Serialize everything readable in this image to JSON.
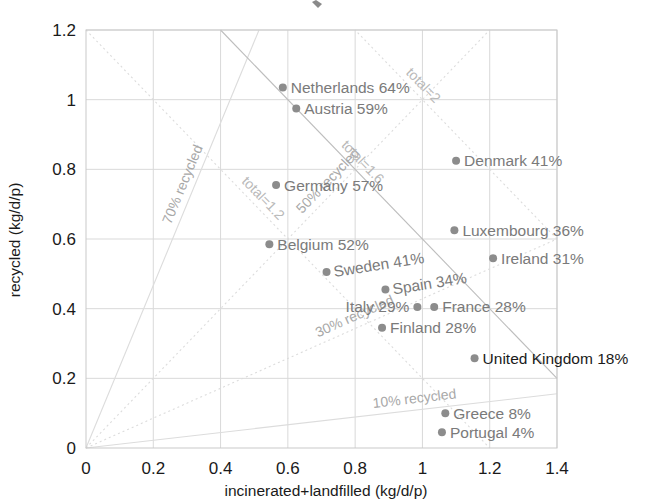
{
  "chart_data": {
    "type": "scatter",
    "title": "",
    "xlabel": "incinerated+landfilled (kg/d/p)",
    "ylabel": "recycled (kg/d/p)",
    "xlim": [
      0,
      1.4
    ],
    "ylim": [
      0,
      1.2
    ],
    "xticks": [
      "0",
      "0.2",
      "0.4",
      "0.6",
      "0.8",
      "1",
      "1.2",
      "1.4"
    ],
    "xtick_values": [
      0,
      0.2,
      0.4,
      0.6,
      0.8,
      1.0,
      1.2,
      1.4
    ],
    "yticks": [
      "0",
      "0.2",
      "0.4",
      "0.6",
      "0.8",
      "1",
      "1.2"
    ],
    "ytick_values": [
      0,
      0.2,
      0.4,
      0.6,
      0.8,
      1.0,
      1.2
    ],
    "grid": true,
    "legend": "none",
    "points": [
      {
        "name": "Netherlands",
        "pct": "64%",
        "label": "Netherlands 64%",
        "x": 0.585,
        "y": 1.035,
        "anchor": "start",
        "rotate": 0,
        "emphasis": false
      },
      {
        "name": "Austria",
        "pct": "59%",
        "label": "Austria 59%",
        "x": 0.625,
        "y": 0.975,
        "anchor": "start",
        "rotate": 0,
        "emphasis": false
      },
      {
        "name": "Germany",
        "pct": "57%",
        "label": "Germany 57%",
        "x": 0.565,
        "y": 0.755,
        "anchor": "start",
        "rotate": 0,
        "emphasis": false
      },
      {
        "name": "Denmark",
        "pct": "41%",
        "label": "Denmark 41%",
        "x": 1.1,
        "y": 0.825,
        "anchor": "start",
        "rotate": 0,
        "emphasis": false
      },
      {
        "name": "Luxembourg",
        "pct": "36%",
        "label": "Luxembourg 36%",
        "x": 1.095,
        "y": 0.625,
        "anchor": "start",
        "rotate": 0,
        "emphasis": false
      },
      {
        "name": "Belgium",
        "pct": "52%",
        "label": "Belgium 52%",
        "x": 0.545,
        "y": 0.585,
        "anchor": "start",
        "rotate": 0,
        "emphasis": false
      },
      {
        "name": "Ireland",
        "pct": "31%",
        "label": "Ireland 31%",
        "x": 1.21,
        "y": 0.545,
        "anchor": "start",
        "rotate": 0,
        "emphasis": false
      },
      {
        "name": "Sweden",
        "pct": "41%",
        "label": "Sweden 41%",
        "x": 0.715,
        "y": 0.505,
        "anchor": "start",
        "rotate": -9,
        "emphasis": false
      },
      {
        "name": "Spain",
        "pct": "34%",
        "label": "Spain 34%",
        "x": 0.89,
        "y": 0.455,
        "anchor": "start",
        "rotate": -9,
        "emphasis": false
      },
      {
        "name": "Italy",
        "pct": "29%",
        "label": "Italy 29%",
        "x": 0.985,
        "y": 0.405,
        "anchor": "end",
        "rotate": 0,
        "emphasis": false
      },
      {
        "name": "France",
        "pct": "28%",
        "label": "France 28%",
        "x": 1.035,
        "y": 0.405,
        "anchor": "start",
        "rotate": 0,
        "emphasis": false
      },
      {
        "name": "Finland",
        "pct": "28%",
        "label": "Finland 28%",
        "x": 0.88,
        "y": 0.345,
        "anchor": "start",
        "rotate": 0,
        "emphasis": false
      },
      {
        "name": "United Kingdom",
        "pct": "18%",
        "label": "United Kingdom 18%",
        "x": 1.155,
        "y": 0.258,
        "anchor": "start",
        "rotate": 0,
        "emphasis": true
      },
      {
        "name": "Greece",
        "pct": "8%",
        "label": "Greece 8%",
        "x": 1.068,
        "y": 0.1,
        "anchor": "start",
        "rotate": 0,
        "emphasis": false
      },
      {
        "name": "Portugal",
        "pct": "4%",
        "label": "Portugal 4%",
        "x": 1.058,
        "y": 0.045,
        "anchor": "start",
        "rotate": 0,
        "emphasis": false
      }
    ],
    "recycled_rays": [
      {
        "label": "70% recycled",
        "pct": 70,
        "style": "solid"
      },
      {
        "label": "50% recycled",
        "pct": 50,
        "style": "dotted"
      },
      {
        "label": "30% recycled",
        "pct": 30,
        "style": "dotted"
      },
      {
        "label": "10% recycled",
        "pct": 10,
        "style": "solid"
      }
    ],
    "total_lines": [
      {
        "label": "total=1.2",
        "total": 1.2,
        "style": "dotted"
      },
      {
        "label": "total=1.6",
        "total": 1.6,
        "style": "solid"
      },
      {
        "label": "total=2",
        "total": 2.0,
        "style": "dotted"
      }
    ],
    "colors": {
      "dot": "#8c8c8c",
      "label": "#7a7a7a",
      "label_emphasis": "#1a1a1a",
      "grid": "#d9d9d9",
      "guide": "#dcdcdc",
      "axis_text": "#1a1a1a",
      "background": "#ffffff"
    }
  }
}
